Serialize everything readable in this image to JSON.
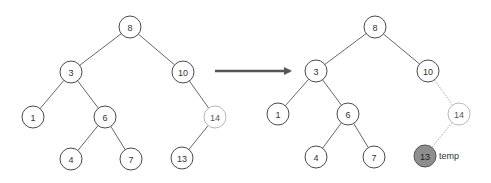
{
  "diagram": {
    "type": "binary-search-tree-transformation",
    "before": {
      "nodes": [
        {
          "id": "b8",
          "label": "8",
          "x": 130,
          "y": 27,
          "style": "normal"
        },
        {
          "id": "b3",
          "label": "3",
          "x": 71,
          "y": 72,
          "style": "normal"
        },
        {
          "id": "b10",
          "label": "10",
          "x": 183,
          "y": 72,
          "style": "normal"
        },
        {
          "id": "b1",
          "label": "1",
          "x": 33,
          "y": 117,
          "style": "normal"
        },
        {
          "id": "b6",
          "label": "6",
          "x": 105,
          "y": 117,
          "style": "normal"
        },
        {
          "id": "b14",
          "label": "14",
          "x": 215,
          "y": 117,
          "style": "faded"
        },
        {
          "id": "b4",
          "label": "4",
          "x": 71,
          "y": 159,
          "style": "normal"
        },
        {
          "id": "b7",
          "label": "7",
          "x": 131,
          "y": 159,
          "style": "normal"
        },
        {
          "id": "b13",
          "label": "13",
          "x": 182,
          "y": 158,
          "style": "normal"
        }
      ],
      "edges": [
        [
          "b8",
          "b3",
          "solid"
        ],
        [
          "b8",
          "b10",
          "solid"
        ],
        [
          "b3",
          "b1",
          "solid"
        ],
        [
          "b3",
          "b6",
          "solid"
        ],
        [
          "b6",
          "b4",
          "solid"
        ],
        [
          "b6",
          "b7",
          "solid"
        ],
        [
          "b10",
          "b14",
          "solid"
        ],
        [
          "b14",
          "b13",
          "solid"
        ]
      ]
    },
    "arrow": {
      "x1": 215,
      "y1": 71,
      "x2": 290,
      "y2": 71,
      "color": "#555555"
    },
    "after": {
      "nodes": [
        {
          "id": "a8",
          "label": "8",
          "x": 375,
          "y": 27,
          "style": "normal"
        },
        {
          "id": "a3",
          "label": "3",
          "x": 316,
          "y": 71,
          "style": "normal"
        },
        {
          "id": "a10",
          "label": "10",
          "x": 428,
          "y": 71,
          "style": "normal"
        },
        {
          "id": "a1",
          "label": "1",
          "x": 278,
          "y": 114,
          "style": "normal"
        },
        {
          "id": "a6",
          "label": "6",
          "x": 348,
          "y": 114,
          "style": "normal"
        },
        {
          "id": "a14",
          "label": "14",
          "x": 459,
          "y": 114,
          "style": "faded"
        },
        {
          "id": "a4",
          "label": "4",
          "x": 316,
          "y": 157,
          "style": "normal"
        },
        {
          "id": "a7",
          "label": "7",
          "x": 374,
          "y": 157,
          "style": "normal"
        },
        {
          "id": "a13",
          "label": "13",
          "x": 425,
          "y": 156,
          "style": "temp"
        }
      ],
      "edges": [
        [
          "a8",
          "a3",
          "solid"
        ],
        [
          "a8",
          "a10",
          "solid"
        ],
        [
          "a3",
          "a1",
          "solid"
        ],
        [
          "a3",
          "a6",
          "solid"
        ],
        [
          "a6",
          "a4",
          "solid"
        ],
        [
          "a6",
          "a7",
          "solid"
        ],
        [
          "a10",
          "a14",
          "dotted"
        ],
        [
          "a14",
          "a13",
          "dotted"
        ]
      ],
      "annotations": [
        {
          "text": "temp",
          "x": 439,
          "y": 159
        }
      ]
    },
    "node_radius": 11,
    "colors": {
      "stroke": "#4a4a4a",
      "faded_stroke": "#b8b8b8",
      "temp_fill": "#8e8e8e",
      "dotted_edge": "#9a9a9a"
    }
  }
}
